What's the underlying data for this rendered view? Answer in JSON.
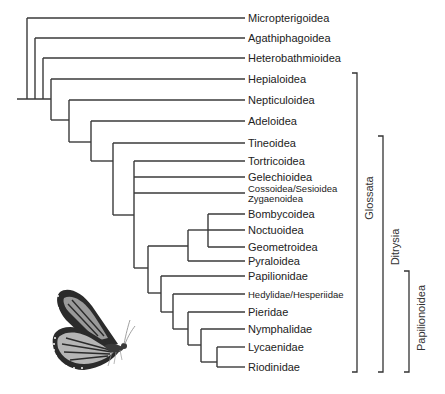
{
  "colors": {
    "line": "#3a3a3a",
    "text": "#222222",
    "background": "#ffffff"
  },
  "taxa": [
    {
      "name": "Micropterigoidea",
      "y": 18,
      "x0": 27,
      "size": "normal"
    },
    {
      "name": "Agathiphagoidea",
      "y": 38,
      "x0": 35,
      "size": "normal"
    },
    {
      "name": "Heterobathmioidea",
      "y": 58,
      "x0": 43,
      "size": "normal"
    },
    {
      "name": "Hepialoidea",
      "y": 79,
      "x0": 51,
      "size": "normal"
    },
    {
      "name": "Nepticuloidea",
      "y": 100,
      "x0": 69,
      "size": "normal"
    },
    {
      "name": "Adeloidea",
      "y": 121,
      "x0": 91,
      "size": "normal"
    },
    {
      "name": "Tineoidea",
      "y": 143,
      "x0": 113,
      "size": "normal"
    },
    {
      "name": "Tortricoidea",
      "y": 161,
      "x0": 134,
      "size": "normal"
    },
    {
      "name": "Gelechioidea",
      "y": 177,
      "x0": 134,
      "size": "normal"
    },
    {
      "name": "Cossoidea/Sesioidea",
      "name2": "Zygaenoidea",
      "y": 193,
      "x0": 134,
      "size": "small"
    },
    {
      "name": "Bombycoidea",
      "y": 214,
      "x0": 208,
      "size": "normal"
    },
    {
      "name": "Noctuoidea",
      "y": 230,
      "x0": 208,
      "size": "normal"
    },
    {
      "name": "Geometroidea",
      "y": 247,
      "x0": 208,
      "size": "normal"
    },
    {
      "name": "Pyraloidea",
      "y": 261,
      "x0": 188,
      "size": "normal"
    },
    {
      "name": "Papilionidae",
      "y": 276,
      "x0": 161,
      "size": "normal"
    },
    {
      "name": "Hedylidae/Hesperiidae",
      "y": 294,
      "x0": 173,
      "size": "small"
    },
    {
      "name": "Pieridae",
      "y": 312,
      "x0": 188,
      "size": "normal"
    },
    {
      "name": "Nymphalidae",
      "y": 329,
      "x0": 201,
      "size": "normal"
    },
    {
      "name": "Lycaenidae",
      "y": 347,
      "x0": 217,
      "size": "normal"
    },
    {
      "name": "Riodinidae",
      "y": 367,
      "x0": 217,
      "size": "normal"
    }
  ],
  "tip_x": 245,
  "label_x": 248,
  "nodes": [
    {
      "x": 27,
      "y1": 18,
      "y2": 99
    },
    {
      "x": 35,
      "y1": 38,
      "y2": 99
    },
    {
      "x": 43,
      "y1": 58,
      "y2": 99
    },
    {
      "x": 51,
      "y1": 79,
      "y2": 120
    },
    {
      "x": 69,
      "y1": 100,
      "y2": 142
    },
    {
      "x": 91,
      "y1": 121,
      "y2": 161
    },
    {
      "x": 113,
      "y1": 143,
      "y2": 215
    },
    {
      "x": 134,
      "y1": 161,
      "y2": 268
    },
    {
      "x": 208,
      "y1": 214,
      "y2": 247
    },
    {
      "x": 188,
      "y1": 230,
      "y2": 261
    },
    {
      "x": 148,
      "y1": 246,
      "y2": 293
    },
    {
      "x": 161,
      "y1": 276,
      "y2": 312
    },
    {
      "x": 173,
      "y1": 294,
      "y2": 329
    },
    {
      "x": 188,
      "y1": 312,
      "y2": 345
    },
    {
      "x": 201,
      "y1": 329,
      "y2": 362
    },
    {
      "x": 217,
      "y1": 347,
      "y2": 367
    }
  ],
  "connectors": [
    {
      "x1": 17,
      "x2": 51,
      "y": 99
    },
    {
      "x1": 51,
      "x2": 69,
      "y": 120
    },
    {
      "x1": 69,
      "x2": 91,
      "y": 142
    },
    {
      "x1": 91,
      "x2": 113,
      "y": 161
    },
    {
      "x1": 113,
      "x2": 134,
      "y": 215
    },
    {
      "x1": 134,
      "x2": 148,
      "y": 268
    },
    {
      "x1": 148,
      "x2": 188,
      "y": 246
    },
    {
      "x1": 188,
      "x2": 208,
      "y": 230
    },
    {
      "x1": 148,
      "x2": 161,
      "y": 293
    },
    {
      "x1": 161,
      "x2": 173,
      "y": 312
    },
    {
      "x1": 173,
      "x2": 188,
      "y": 329
    },
    {
      "x1": 188,
      "x2": 201,
      "y": 345
    },
    {
      "x1": 201,
      "x2": 217,
      "y": 362
    }
  ],
  "clades": [
    {
      "name": "Glossata",
      "x": 357,
      "y1": 73,
      "y2": 372,
      "label_x": 373,
      "label_y": 198
    },
    {
      "name": "Ditrysia",
      "x": 383,
      "y1": 136,
      "y2": 372,
      "label_x": 399,
      "label_y": 247
    },
    {
      "name": "Papilionoidea",
      "x": 409,
      "y1": 271,
      "y2": 372,
      "label_x": 425,
      "label_y": 318
    }
  ],
  "image": {
    "name": "monarch-butterfly",
    "x": 38,
    "y": 286,
    "w": 95,
    "h": 85
  }
}
